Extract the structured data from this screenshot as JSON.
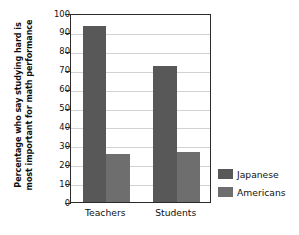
{
  "chart_data": {
    "type": "bar",
    "title": "",
    "xlabel": "",
    "ylabel": "Percentage who say studying hard is most important for math performance",
    "ylabel_lines": [
      "Percentage who say studying hard is",
      "most important for math performance"
    ],
    "categories": [
      "Teachers",
      "Students"
    ],
    "series": [
      {
        "name": "Japanese",
        "values": [
          93,
          72
        ],
        "color": "#585858"
      },
      {
        "name": "Americans",
        "values": [
          25.5,
          26.5
        ],
        "color": "#6e6e6e"
      }
    ],
    "ylim": [
      0,
      100
    ],
    "ytick_values": [
      0,
      10,
      20,
      30,
      40,
      50,
      60,
      70,
      80,
      90,
      100
    ],
    "ytick_labels": [
      "0",
      "10",
      "20",
      "30",
      "40",
      "50",
      "60",
      "70",
      "80",
      "90",
      "100"
    ],
    "grid": true,
    "grid_axis": "y",
    "legend_position": "right",
    "legend_entries": [
      "Japanese",
      "Americans"
    ],
    "axis_color": "#2b2b2b",
    "grid_color": "#d2d2d2",
    "background_color": "#ffffff"
  }
}
